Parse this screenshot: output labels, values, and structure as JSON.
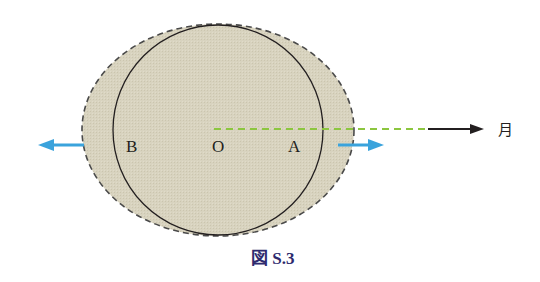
{
  "figure": {
    "caption": "図 S.3",
    "labels": {
      "B": "B",
      "O": "O",
      "A": "A",
      "moon": "月"
    },
    "colors": {
      "fill": "#d6d1bd",
      "outline_dashed": "#4a4a4a",
      "circle": "#231f20",
      "arrow_blue": "#3aa3dc",
      "dash_green": "#8cc63f",
      "arrow_black": "#231f20",
      "caption": "#2d2a6e"
    },
    "icons": {
      "left_arrow": "blue-left-arrow-icon",
      "right_arrow": "blue-right-arrow-icon",
      "moon_arrow": "black-right-arrow-icon"
    }
  }
}
